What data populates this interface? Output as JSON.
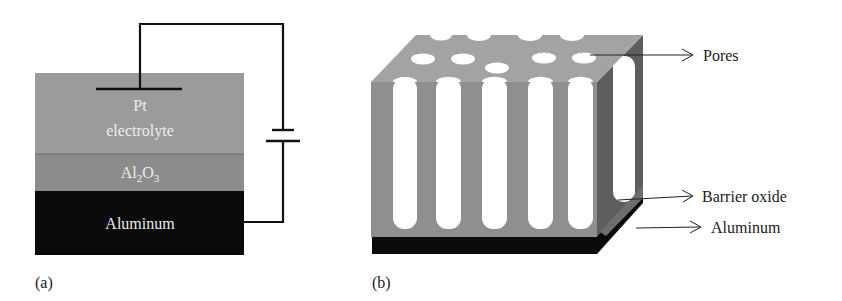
{
  "panel_a": {
    "caption": "(a)",
    "layers": {
      "electrolyte_line1": "Pt",
      "electrolyte_line2": "electrolyte",
      "oxide_main": "Al",
      "oxide_sub1": "2",
      "oxide_mid": "O",
      "oxide_sub2": "3",
      "metal": "Aluminum"
    },
    "colors": {
      "electrolyte": "#9b9b9b",
      "oxide": "#8c8c8c",
      "metal": "#0a0a0a",
      "layer_text": "#ececec",
      "wire": "#111111"
    }
  },
  "panel_b": {
    "caption": "(b)",
    "labels": {
      "pores": "Pores",
      "barrier_oxide": "Barrier oxide",
      "aluminum": "Aluminum"
    },
    "colors": {
      "top_face": "#a3a3a3",
      "front_face": "#8f8f8f",
      "side_face": "#5e5e5e",
      "pore": "#ffffff",
      "base": "#0a0a0a"
    }
  }
}
